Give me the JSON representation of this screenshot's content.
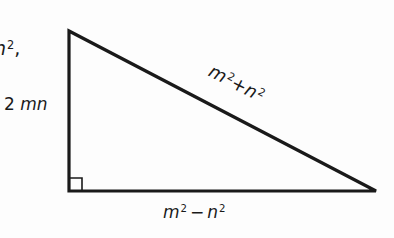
{
  "diagram": {
    "type": "right-triangle",
    "stroke_color": "#1a1a1a",
    "background_color": "#fdfdfd",
    "vertices": {
      "top_left": [
        69,
        31
      ],
      "bottom_left": [
        69,
        191
      ],
      "bottom_right": [
        376,
        191
      ]
    },
    "right_angle_marker": {
      "corner": "bottom_left",
      "size": 13
    },
    "labels": {
      "fragment_left": {
        "base": "n",
        "sup": "2",
        "suffix": ","
      },
      "vertical_leg": {
        "prefix": "2 ",
        "var": "mn"
      },
      "hypotenuse": {
        "a": "m",
        "a_sup": "2",
        "op": "+",
        "b": "n",
        "b_sup": "2"
      },
      "horizontal_leg": {
        "a": "m",
        "a_sup": "2",
        "op": "−",
        "b": "n",
        "b_sup": "2"
      }
    }
  }
}
